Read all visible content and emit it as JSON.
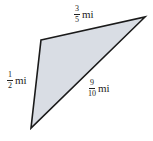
{
  "diagram": {
    "shape": "triangle",
    "fill_color": "#d9dde4",
    "stroke_color": "#1a1a1a",
    "vertices": [
      [
        41,
        40
      ],
      [
        145,
        17
      ],
      [
        31,
        128
      ]
    ],
    "sides": [
      {
        "id": "top",
        "numerator": "3",
        "denominator": "5",
        "unit": "mi"
      },
      {
        "id": "left",
        "numerator": "1",
        "denominator": "2",
        "unit": "mi"
      },
      {
        "id": "hypotenuse",
        "numerator": "9",
        "denominator": "10",
        "unit": "mi"
      }
    ]
  }
}
